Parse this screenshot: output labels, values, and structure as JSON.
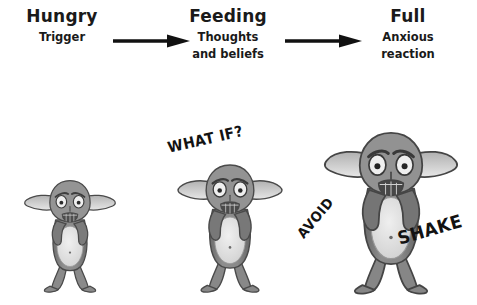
{
  "diagram": {
    "background_color": "#ffffff",
    "ink_color": "#1a1a1a"
  },
  "stages": [
    {
      "id": "hungry",
      "title": "Hungry",
      "subtitle_lines": [
        "Trigger"
      ],
      "subtitle": "Trigger"
    },
    {
      "id": "feeding",
      "title": "Feeding",
      "subtitle_lines": [
        "Thoughts",
        "and beliefs"
      ],
      "subtitle": "Thoughts and beliefs"
    },
    {
      "id": "full",
      "title": "Full",
      "subtitle_lines": [
        "Anxious",
        "reaction"
      ],
      "subtitle": "Anxious reaction"
    }
  ],
  "arrows": [
    {
      "id": "arrow-hungry-to-feeding",
      "icon": "right-arrow-icon",
      "color": "#111111"
    },
    {
      "id": "arrow-feeding-to-full",
      "icon": "right-arrow-icon",
      "color": "#111111"
    }
  ],
  "figures": [
    {
      "id": "creature-small",
      "label": "worried creature small",
      "size": "small",
      "body_color": "#8d8d8d",
      "belly_color": "#e2e2e2",
      "outline_color": "#4a4a4a"
    },
    {
      "id": "creature-medium",
      "label": "worried creature medium",
      "size": "medium",
      "body_color": "#8a8a8a",
      "belly_color": "#e2e2e2",
      "outline_color": "#4a4a4a"
    },
    {
      "id": "creature-large",
      "label": "worried creature large",
      "size": "large",
      "body_color": "#878787",
      "belly_color": "#e2e2e2",
      "outline_color": "#454545"
    }
  ],
  "shouts": [
    {
      "id": "what-if",
      "text": "WHAT IF?",
      "color": "#121212"
    },
    {
      "id": "avoid",
      "text": "AVOID",
      "color": "#121212"
    },
    {
      "id": "shake",
      "text": "SHAKE",
      "color": "#121212"
    }
  ]
}
